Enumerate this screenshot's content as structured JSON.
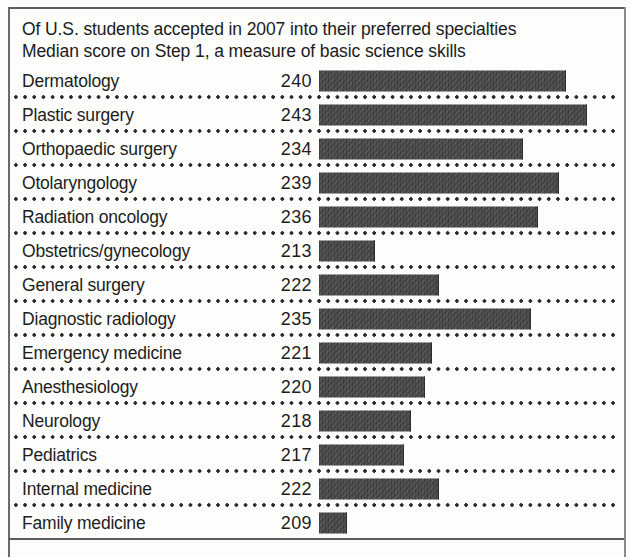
{
  "headline": {
    "line1": "Of U.S. students accepted in 2007 into their preferred specialties",
    "line2": "Median score on Step 1, a measure of basic science skills"
  },
  "chart_data": {
    "type": "bar",
    "orientation": "horizontal",
    "title": "Of U.S. students accepted in 2007 into their preferred specialties",
    "subtitle": "Median score on Step 1, a measure of basic science skills",
    "xlabel": "",
    "ylabel": "",
    "grid": false,
    "legend": null,
    "value_labels_shown": true,
    "axis_baseline": 205,
    "xlim": [
      205,
      245
    ],
    "categories": [
      "Dermatology",
      "Plastic surgery",
      "Orthopaedic surgery",
      "Otolaryngology",
      "Radiation oncology",
      "Obstetrics/gynecology",
      "General surgery",
      "Diagnostic radiology",
      "Emergency medicine",
      "Anesthesiology",
      "Neurology",
      "Pediatrics",
      "Internal medicine",
      "Family medicine"
    ],
    "values": [
      240,
      243,
      234,
      239,
      236,
      213,
      222,
      235,
      221,
      220,
      218,
      217,
      222,
      209
    ],
    "bar_color": "#4a4a4a"
  },
  "rows": [
    {
      "label": "Dermatology",
      "value": "240"
    },
    {
      "label": "Plastic surgery",
      "value": "243"
    },
    {
      "label": "Orthopaedic surgery",
      "value": "234"
    },
    {
      "label": "Otolaryngology",
      "value": "239"
    },
    {
      "label": "Radiation oncology",
      "value": "236"
    },
    {
      "label": "Obstetrics/gynecology",
      "value": "213"
    },
    {
      "label": "General surgery",
      "value": "222"
    },
    {
      "label": "Diagnostic radiology",
      "value": "235"
    },
    {
      "label": "Emergency medicine",
      "value": "221"
    },
    {
      "label": "Anesthesiology",
      "value": "220"
    },
    {
      "label": "Neurology",
      "value": "218"
    },
    {
      "label": "Pediatrics",
      "value": "217"
    },
    {
      "label": "Internal medicine",
      "value": "222"
    },
    {
      "label": "Family medicine",
      "value": "209"
    }
  ]
}
